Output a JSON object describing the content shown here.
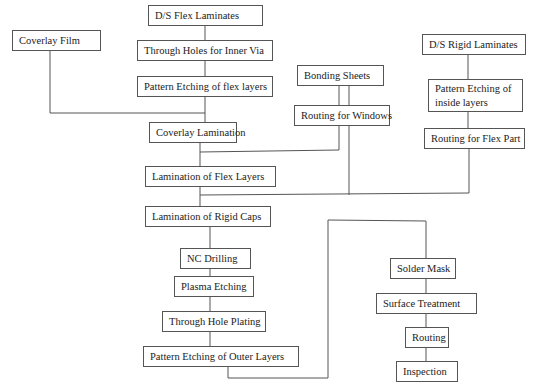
{
  "diagram": {
    "type": "flowchart",
    "title": "",
    "nodes": [
      {
        "id": "ds_flex",
        "label": "D/S Flex Laminates"
      },
      {
        "id": "coverlay_film",
        "label": "Coverlay Film"
      },
      {
        "id": "through_holes",
        "label": "Through Holes for Inner Via"
      },
      {
        "id": "pattern_flex",
        "label": "Pattern Etching of flex layers"
      },
      {
        "id": "ds_rigid",
        "label": "D/S Rigid Laminates"
      },
      {
        "id": "bonding",
        "label": "Bonding Sheets"
      },
      {
        "id": "pattern_inside",
        "label": "Pattern Etching of inside layers"
      },
      {
        "id": "routing_windows",
        "label": "Routing for Windows"
      },
      {
        "id": "coverlay_lam",
        "label": "Coverlay Lamination"
      },
      {
        "id": "routing_flex",
        "label": "Routing for Flex Part"
      },
      {
        "id": "lam_flex",
        "label": "Lamination of Flex Layers"
      },
      {
        "id": "lam_rigid",
        "label": "Lamination of Rigid Caps"
      },
      {
        "id": "nc_drill",
        "label": "NC Drilling"
      },
      {
        "id": "plasma",
        "label": "Plasma Etching"
      },
      {
        "id": "th_plating",
        "label": "Through Hole Plating"
      },
      {
        "id": "pattern_outer",
        "label": "Pattern Etching of Outer Layers"
      },
      {
        "id": "solder",
        "label": "Solder Mask"
      },
      {
        "id": "surface",
        "label": "Surface Treatment"
      },
      {
        "id": "routing",
        "label": "Routing"
      },
      {
        "id": "inspection",
        "label": "Inspection"
      }
    ],
    "edges": [
      [
        "ds_flex",
        "through_holes"
      ],
      [
        "through_holes",
        "pattern_flex"
      ],
      [
        "pattern_flex",
        "coverlay_lam"
      ],
      [
        "coverlay_film",
        "coverlay_lam"
      ],
      [
        "bonding",
        "routing_windows"
      ],
      [
        "routing_windows",
        "lam_flex"
      ],
      [
        "coverlay_lam",
        "lam_flex"
      ],
      [
        "bonding",
        "lam_rigid"
      ],
      [
        "ds_rigid",
        "pattern_inside"
      ],
      [
        "pattern_inside",
        "routing_flex"
      ],
      [
        "routing_flex",
        "lam_rigid"
      ],
      [
        "lam_flex",
        "lam_rigid"
      ],
      [
        "lam_rigid",
        "nc_drill"
      ],
      [
        "nc_drill",
        "plasma"
      ],
      [
        "plasma",
        "th_plating"
      ],
      [
        "th_plating",
        "pattern_outer"
      ],
      [
        "pattern_outer",
        "solder"
      ],
      [
        "solder",
        "surface"
      ],
      [
        "surface",
        "routing"
      ],
      [
        "routing",
        "inspection"
      ]
    ]
  }
}
